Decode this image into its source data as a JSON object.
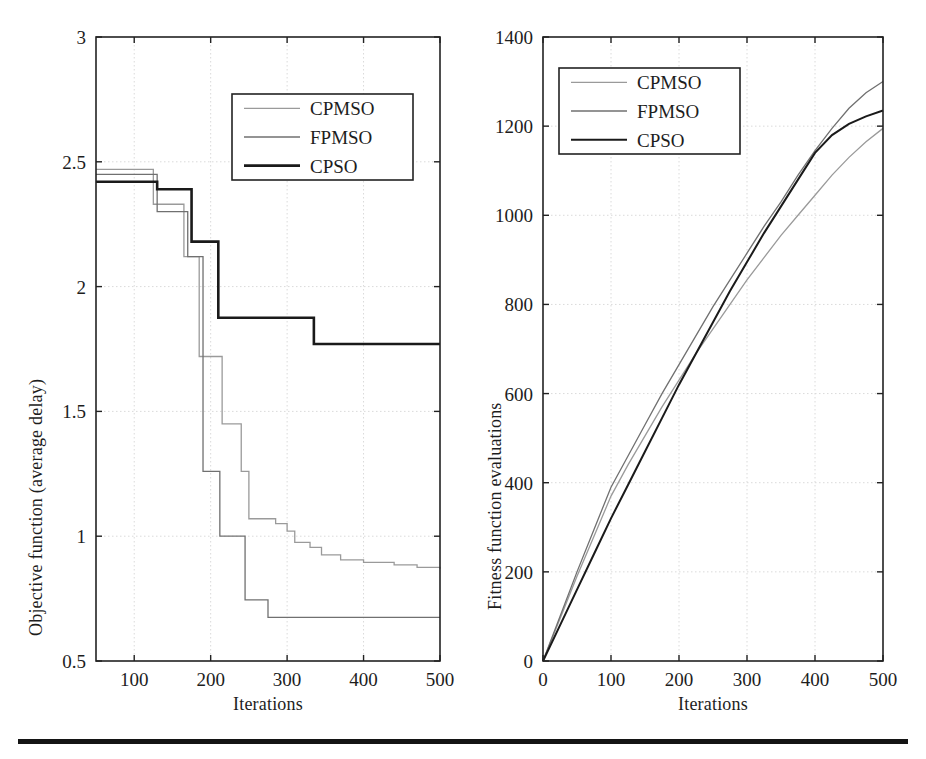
{
  "figure": {
    "background": "#ffffff",
    "bottom_rule_color": "#141414"
  },
  "panels": [
    {
      "id": "left",
      "xlabel": "Iterations",
      "ylabel": "Objective function (average delay)",
      "x_ticks": [
        "100",
        "200",
        "300",
        "400",
        "500"
      ],
      "y_ticks": [
        "0.5",
        "1",
        "1.5",
        "2",
        "2.5",
        "3"
      ],
      "legend": [
        {
          "label": "CPMSO",
          "color": "#9a9a9a",
          "width": 1.3
        },
        {
          "label": "FPMSO",
          "color": "#707070",
          "width": 1.3
        },
        {
          "label": "CPSO",
          "color": "#1a1a1a",
          "width": 2.6
        }
      ]
    },
    {
      "id": "right",
      "xlabel": "Iterations",
      "ylabel": "Fitness function evaluations",
      "x_ticks": [
        "0",
        "100",
        "200",
        "300",
        "400",
        "500"
      ],
      "y_ticks": [
        "0",
        "200",
        "400",
        "600",
        "800",
        "1000",
        "1200",
        "1400"
      ],
      "legend": [
        {
          "label": "CPMSO",
          "color": "#9a9a9a",
          "width": 1.3
        },
        {
          "label": "FPMSO",
          "color": "#707070",
          "width": 1.3
        },
        {
          "label": "CPSO",
          "color": "#1a1a1a",
          "width": 2.0
        }
      ]
    }
  ],
  "chart_data": [
    {
      "type": "line",
      "id": "objective-convergence",
      "title": "",
      "xlabel": "Iterations",
      "ylabel": "Objective function (average delay)",
      "xlim": [
        50,
        500
      ],
      "ylim": [
        0.5,
        3
      ],
      "xticks": [
        100,
        200,
        300,
        400,
        500
      ],
      "yticks": [
        0.5,
        1,
        1.5,
        2,
        2.5,
        3
      ],
      "grid": true,
      "drawstyle": "steps-post",
      "legend_position": "upper-right-inside",
      "series": [
        {
          "name": "CPMSO",
          "color": "#9a9a9a",
          "x": [
            50,
            120,
            125,
            150,
            165,
            180,
            185,
            210,
            215,
            225,
            240,
            250,
            270,
            285,
            300,
            310,
            330,
            345,
            370,
            400,
            440,
            470,
            500
          ],
          "y": [
            2.47,
            2.47,
            2.33,
            2.33,
            2.12,
            2.12,
            1.72,
            1.72,
            1.45,
            1.45,
            1.26,
            1.07,
            1.07,
            1.05,
            1.02,
            0.975,
            0.955,
            0.925,
            0.905,
            0.895,
            0.885,
            0.875,
            0.87
          ]
        },
        {
          "name": "FPMSO",
          "color": "#707070",
          "x": [
            50,
            120,
            130,
            150,
            170,
            180,
            190,
            205,
            212,
            240,
            245,
            270,
            275,
            330,
            400,
            500
          ],
          "y": [
            2.45,
            2.45,
            2.3,
            2.3,
            2.12,
            2.12,
            1.26,
            1.26,
            1.0,
            1.0,
            0.745,
            0.745,
            0.675,
            0.675,
            0.675,
            0.675
          ]
        },
        {
          "name": "CPSO",
          "color": "#1a1a1a",
          "x": [
            50,
            125,
            130,
            170,
            175,
            205,
            210,
            330,
            335,
            500
          ],
          "y": [
            2.42,
            2.42,
            2.39,
            2.39,
            2.18,
            2.18,
            1.875,
            1.875,
            1.77,
            1.77
          ]
        }
      ]
    },
    {
      "type": "line",
      "id": "fitness-evaluations",
      "title": "",
      "xlabel": "Iterations",
      "ylabel": "Fitness function evaluations",
      "xlim": [
        0,
        500
      ],
      "ylim": [
        0,
        1400
      ],
      "xticks": [
        0,
        100,
        200,
        300,
        400,
        500
      ],
      "yticks": [
        0,
        200,
        400,
        600,
        800,
        1000,
        1200,
        1400
      ],
      "grid": true,
      "drawstyle": "default",
      "legend_position": "upper-left-inside",
      "series": [
        {
          "name": "CPMSO",
          "color": "#9a9a9a",
          "x": [
            0,
            25,
            50,
            75,
            100,
            125,
            150,
            175,
            200,
            225,
            250,
            275,
            300,
            325,
            350,
            375,
            400,
            425,
            450,
            475,
            500
          ],
          "y": [
            0,
            95,
            190,
            280,
            370,
            440,
            505,
            570,
            630,
            690,
            745,
            800,
            855,
            905,
            955,
            1000,
            1045,
            1090,
            1130,
            1165,
            1195
          ]
        },
        {
          "name": "FPMSO",
          "color": "#707070",
          "x": [
            0,
            25,
            50,
            75,
            100,
            125,
            150,
            175,
            200,
            225,
            250,
            275,
            300,
            325,
            350,
            375,
            400,
            425,
            450,
            475,
            500
          ],
          "y": [
            0,
            100,
            200,
            295,
            390,
            460,
            530,
            600,
            665,
            730,
            795,
            855,
            915,
            975,
            1030,
            1090,
            1145,
            1195,
            1240,
            1275,
            1300
          ]
        },
        {
          "name": "CPSO",
          "color": "#1a1a1a",
          "x": [
            0,
            25,
            50,
            75,
            100,
            125,
            150,
            175,
            200,
            225,
            250,
            275,
            300,
            325,
            350,
            375,
            400,
            425,
            450,
            475,
            500
          ],
          "y": [
            0,
            80,
            160,
            240,
            320,
            395,
            470,
            545,
            620,
            690,
            760,
            830,
            895,
            960,
            1020,
            1080,
            1140,
            1180,
            1205,
            1222,
            1235
          ]
        }
      ]
    }
  ]
}
